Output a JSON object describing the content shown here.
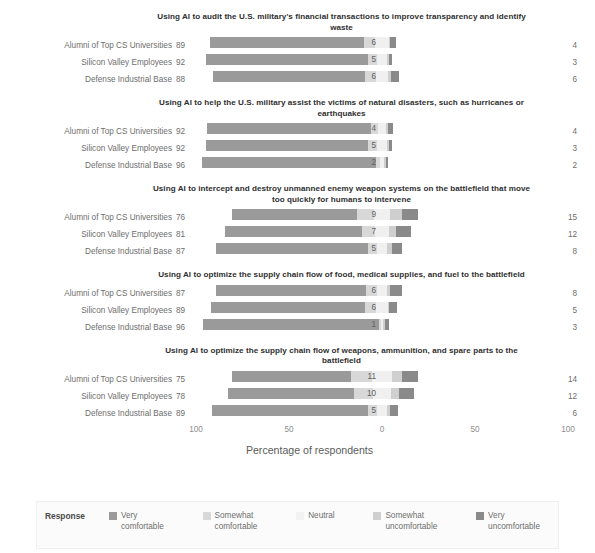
{
  "chart_data": {
    "type": "bar",
    "subtype": "diverging-stacked-likert",
    "title": "",
    "xlabel": "Percentage of respondents",
    "ylabel": "",
    "xlim": [
      -100,
      100
    ],
    "xticks": [
      100,
      50,
      0,
      50,
      100
    ],
    "grid": false,
    "legend_position": "bottom",
    "legend_title": "Response",
    "categories": [
      "Alumni of Top CS Universities",
      "Silicon Valley Employees",
      "Defense Industrial Base"
    ],
    "series": [
      {
        "name": "Very comfortable",
        "color": "#9a9a9a"
      },
      {
        "name": "Somewhat comfortable",
        "color": "#d8d8d8"
      },
      {
        "name": "Neutral",
        "color": "#f0f0f0"
      },
      {
        "name": "Somewhat uncomfortable",
        "color": "#cfcfcf"
      },
      {
        "name": "Very uncomfortable",
        "color": "#8a8a8a"
      }
    ],
    "panels": [
      {
        "title": "Using AI to audit the U.S. military's financial transactions to improve transparency and identify waste",
        "rows": [
          {
            "group": "Alumni of Top CS Universities",
            "left_total": 89,
            "right_total": 4,
            "very_comfortable": 83,
            "somewhat_comfortable": 6,
            "neutral": 7,
            "somewhat_uncomfortable": 1,
            "very_uncomfortable": 3,
            "mid_label": "6"
          },
          {
            "group": "Silicon Valley Employees",
            "left_total": 92,
            "right_total": 3,
            "very_comfortable": 87,
            "somewhat_comfortable": 5,
            "neutral": 5,
            "somewhat_uncomfortable": 1,
            "very_uncomfortable": 2,
            "mid_label": "5"
          },
          {
            "group": "Defense Industrial Base",
            "left_total": 88,
            "right_total": 6,
            "very_comfortable": 82,
            "somewhat_comfortable": 6,
            "neutral": 6,
            "somewhat_uncomfortable": 2,
            "very_uncomfortable": 4,
            "mid_label": "6"
          }
        ]
      },
      {
        "title": "Using AI to help the U.S. military assist the victims of natural disasters, such as hurricanes or earthquakes",
        "rows": [
          {
            "group": "Alumni of Top CS Universities",
            "left_total": 92,
            "right_total": 4,
            "very_comfortable": 88,
            "somewhat_comfortable": 4,
            "neutral": 4,
            "somewhat_uncomfortable": 1,
            "very_uncomfortable": 3,
            "mid_label": "4"
          },
          {
            "group": "Silicon Valley Employees",
            "left_total": 92,
            "right_total": 3,
            "very_comfortable": 87,
            "somewhat_comfortable": 5,
            "neutral": 5,
            "somewhat_uncomfortable": 1,
            "very_uncomfortable": 2,
            "mid_label": "5"
          },
          {
            "group": "Defense Industrial Base",
            "left_total": 96,
            "right_total": 2,
            "very_comfortable": 94,
            "somewhat_comfortable": 2,
            "neutral": 2,
            "somewhat_uncomfortable": 1,
            "very_uncomfortable": 1,
            "mid_label": "2"
          }
        ]
      },
      {
        "title": "Using AI to intercept and destroy unmanned enemy weapon systems on the battlefield that move too quickly for humans to intervene",
        "rows": [
          {
            "group": "Alumni of Top CS Universities",
            "left_total": 76,
            "right_total": 15,
            "very_comfortable": 67,
            "somewhat_comfortable": 9,
            "neutral": 9,
            "somewhat_uncomfortable": 6,
            "very_uncomfortable": 9,
            "mid_label": "9"
          },
          {
            "group": "Silicon Valley Employees",
            "left_total": 81,
            "right_total": 12,
            "very_comfortable": 74,
            "somewhat_comfortable": 7,
            "neutral": 7,
            "somewhat_uncomfortable": 4,
            "very_uncomfortable": 8,
            "mid_label": "7"
          },
          {
            "group": "Defense Industrial Base",
            "left_total": 87,
            "right_total": 8,
            "very_comfortable": 82,
            "somewhat_comfortable": 5,
            "neutral": 5,
            "somewhat_uncomfortable": 3,
            "very_uncomfortable": 5,
            "mid_label": "5"
          }
        ]
      },
      {
        "title": "Using AI to optimize the supply chain flow of food, medical supplies, and fuel to the battlefield",
        "rows": [
          {
            "group": "Alumni of Top CS Universities",
            "left_total": 87,
            "right_total": 8,
            "very_comfortable": 81,
            "somewhat_comfortable": 6,
            "neutral": 5,
            "somewhat_uncomfortable": 2,
            "very_uncomfortable": 6,
            "mid_label": "6"
          },
          {
            "group": "Silicon Valley Employees",
            "left_total": 89,
            "right_total": 5,
            "very_comfortable": 83,
            "somewhat_comfortable": 6,
            "neutral": 6,
            "somewhat_uncomfortable": 1,
            "very_uncomfortable": 4,
            "mid_label": "6"
          },
          {
            "group": "Defense Industrial Base",
            "left_total": 96,
            "right_total": 3,
            "very_comfortable": 95,
            "somewhat_comfortable": 1,
            "neutral": 1,
            "somewhat_uncomfortable": 1,
            "very_uncomfortable": 2,
            "mid_label": "1"
          }
        ]
      },
      {
        "title": "Using AI to optimize the supply chain flow of weapons, ammunition, and spare parts to the battlefield",
        "rows": [
          {
            "group": "Alumni of Top CS Universities",
            "left_total": 75,
            "right_total": 14,
            "very_comfortable": 64,
            "somewhat_comfortable": 11,
            "neutral": 11,
            "somewhat_uncomfortable": 5,
            "very_uncomfortable": 9,
            "mid_label": "11"
          },
          {
            "group": "Silicon Valley Employees",
            "left_total": 78,
            "right_total": 12,
            "very_comfortable": 68,
            "somewhat_comfortable": 10,
            "neutral": 10,
            "somewhat_uncomfortable": 4,
            "very_uncomfortable": 8,
            "mid_label": "10"
          },
          {
            "group": "Defense Industrial Base",
            "left_total": 89,
            "right_total": 6,
            "very_comfortable": 84,
            "somewhat_comfortable": 5,
            "neutral": 5,
            "somewhat_uncomfortable": 2,
            "very_uncomfortable": 4,
            "mid_label": "5"
          }
        ]
      }
    ]
  },
  "axis": {
    "ticks": [
      "100",
      "50",
      "0",
      "50",
      "100"
    ],
    "title": "Percentage of respondents"
  },
  "legend": {
    "title": "Response",
    "items": [
      {
        "label": "Very\ncomfortable",
        "color": "#9a9a9a"
      },
      {
        "label": "Somewhat\ncomfortable",
        "color": "#d8d8d8"
      },
      {
        "label": "Neutral",
        "color": "#f2f2f2"
      },
      {
        "label": "Somewhat\nuncomfortable",
        "color": "#cfcfcf"
      },
      {
        "label": "Very\nuncomfortable",
        "color": "#8a8a8a"
      }
    ]
  }
}
